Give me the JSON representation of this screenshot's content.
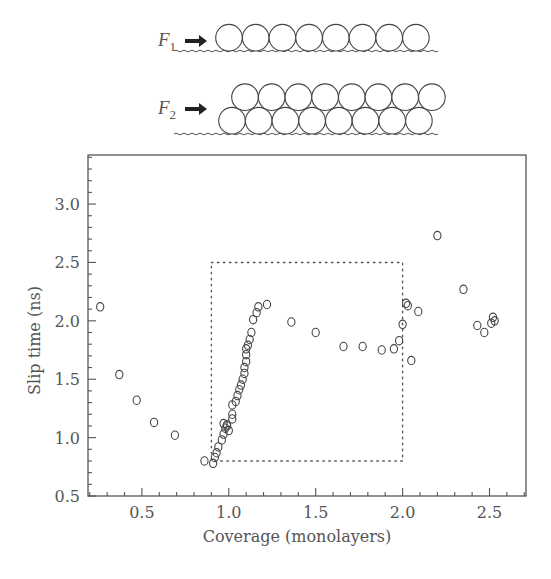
{
  "schematic": {
    "row1": {
      "force_label": "F",
      "subscript": "1",
      "layers": 1,
      "spheres_per_layer": 8
    },
    "row2": {
      "force_label": "F",
      "subscript": "2",
      "layers": 2,
      "spheres_per_layer": 8
    }
  },
  "chart_data": {
    "type": "scatter",
    "title": "",
    "xlabel": "Coverage (monolayers)",
    "ylabel": "Slip time (ns)",
    "xlim": [
      0.19,
      2.71
    ],
    "ylim": [
      0.5,
      3.42
    ],
    "x_ticks": [
      0.5,
      1.0,
      1.5,
      2.0,
      2.5
    ],
    "x_tick_labels": [
      "0.5",
      "1.0",
      "1.5",
      "2.0",
      "2.5"
    ],
    "y_ticks": [
      0.5,
      1.0,
      1.5,
      2.0,
      2.5,
      3.0
    ],
    "y_tick_labels": [
      "0.5",
      "1.0",
      "1.5",
      "2.0",
      "2.5",
      "3.0"
    ],
    "grid": false,
    "legend": null,
    "marker": "open-circle",
    "annotations": [
      {
        "type": "dotted-rectangle",
        "x0": 0.9,
        "x1": 2.0,
        "y0": 0.8,
        "y1": 2.5
      }
    ],
    "series": [
      {
        "name": "slip time",
        "points": [
          [
            0.26,
            2.12
          ],
          [
            0.37,
            1.54
          ],
          [
            0.47,
            1.32
          ],
          [
            0.57,
            1.13
          ],
          [
            0.69,
            1.02
          ],
          [
            0.86,
            0.8
          ],
          [
            0.91,
            0.78
          ],
          [
            0.92,
            0.83
          ],
          [
            0.93,
            0.87
          ],
          [
            0.94,
            0.92
          ],
          [
            0.96,
            0.98
          ],
          [
            0.97,
            1.03
          ],
          [
            0.98,
            1.08
          ],
          [
            0.99,
            1.11
          ],
          [
            0.97,
            1.12
          ],
          [
            0.99,
            1.1
          ],
          [
            1.0,
            1.06
          ],
          [
            1.02,
            1.16
          ],
          [
            1.02,
            1.2
          ],
          [
            1.02,
            1.28
          ],
          [
            1.04,
            1.31
          ],
          [
            1.05,
            1.36
          ],
          [
            1.06,
            1.41
          ],
          [
            1.07,
            1.45
          ],
          [
            1.08,
            1.5
          ],
          [
            1.09,
            1.55
          ],
          [
            1.09,
            1.6
          ],
          [
            1.1,
            1.65
          ],
          [
            1.1,
            1.71
          ],
          [
            1.1,
            1.76
          ],
          [
            1.11,
            1.79
          ],
          [
            1.12,
            1.84
          ],
          [
            1.13,
            1.9
          ],
          [
            1.14,
            2.01
          ],
          [
            1.16,
            2.07
          ],
          [
            1.17,
            2.12
          ],
          [
            1.22,
            2.14
          ],
          [
            1.36,
            1.99
          ],
          [
            1.5,
            1.9
          ],
          [
            1.66,
            1.78
          ],
          [
            1.77,
            1.78
          ],
          [
            1.88,
            1.75
          ],
          [
            1.95,
            1.76
          ],
          [
            1.98,
            1.83
          ],
          [
            2.0,
            1.97
          ],
          [
            2.02,
            2.15
          ],
          [
            2.03,
            2.13
          ],
          [
            2.05,
            1.66
          ],
          [
            2.09,
            2.08
          ],
          [
            2.2,
            2.73
          ],
          [
            2.35,
            2.27
          ],
          [
            2.43,
            1.96
          ],
          [
            2.47,
            1.9
          ],
          [
            2.51,
            1.98
          ],
          [
            2.52,
            2.03
          ],
          [
            2.53,
            2.0
          ]
        ]
      }
    ]
  }
}
